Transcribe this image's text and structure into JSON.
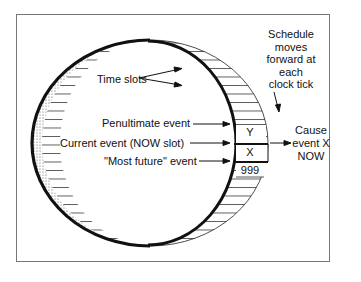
{
  "diagram": {
    "labels": {
      "time_slots": "Time slots",
      "penultimate": "Penultimate event",
      "current": "Current event (NOW slot)",
      "most_future": "\"Most future\" event",
      "schedule": [
        "Schedule",
        "moves",
        "forward at",
        "each",
        "clock tick"
      ],
      "cause": [
        "Cause",
        "event X",
        "NOW"
      ]
    },
    "slots": {
      "y": "Y",
      "x": "X",
      "future": "999"
    },
    "colors": {
      "line": "#111111",
      "frame": "#777777",
      "background": "#ffffff"
    }
  }
}
